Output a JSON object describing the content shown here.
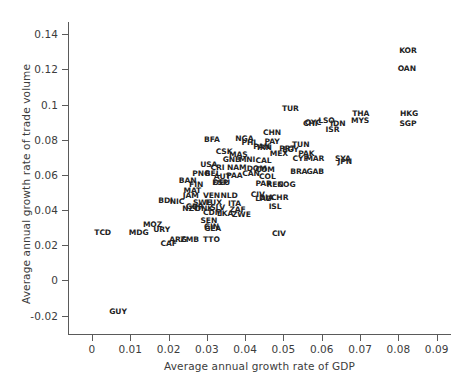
{
  "chart_data": {
    "type": "scatter",
    "title": "",
    "xlabel": "Average annual growth rate of GDP",
    "ylabel": "Average annual growth rate of trade volume",
    "xlim": [
      -0.006,
      0.094
    ],
    "ylim": [
      -0.031,
      0.147
    ],
    "xticks": [
      "0",
      "0.01",
      "0.02",
      "0.03",
      "0.04",
      "0.05",
      "0.06",
      "0.07",
      "0.08",
      "0.09"
    ],
    "xtick_values": [
      0,
      0.01,
      0.02,
      0.03,
      0.04,
      0.05,
      0.06,
      0.07,
      0.08,
      0.09
    ],
    "yticks": [
      "-0.02",
      "0",
      "0.02",
      "0.04",
      "0.06",
      "0.08",
      "0.1",
      "0.12",
      "0.14"
    ],
    "ytick_values": [
      -0.02,
      0,
      0.02,
      0.04,
      0.06,
      0.08,
      0.1,
      0.12,
      0.14
    ],
    "grid": false,
    "legend": null,
    "marker_style": "text-label",
    "point_label_field": "code",
    "points": [
      {
        "code": "KOR",
        "x": 0.0825,
        "y": 0.1305
      },
      {
        "code": "OAN",
        "x": 0.0822,
        "y": 0.1205
      },
      {
        "code": "TUR",
        "x": 0.0518,
        "y": 0.0975
      },
      {
        "code": "THA",
        "x": 0.0702,
        "y": 0.0945
      },
      {
        "code": "HKG",
        "x": 0.0828,
        "y": 0.0945
      },
      {
        "code": "MYS",
        "x": 0.07,
        "y": 0.0905
      },
      {
        "code": "SGP",
        "x": 0.0825,
        "y": 0.0888
      },
      {
        "code": "LSO",
        "x": 0.0612,
        "y": 0.0908
      },
      {
        "code": "IDN",
        "x": 0.0642,
        "y": 0.089
      },
      {
        "code": "OYC",
        "x": 0.0577,
        "y": 0.0893
      },
      {
        "code": "CHI",
        "x": 0.057,
        "y": 0.0888
      },
      {
        "code": "ISR",
        "x": 0.0628,
        "y": 0.0858
      },
      {
        "code": "BFA",
        "x": 0.0313,
        "y": 0.08
      },
      {
        "code": "CHN",
        "x": 0.047,
        "y": 0.084
      },
      {
        "code": "NGA",
        "x": 0.0398,
        "y": 0.0805
      },
      {
        "code": "PAY",
        "x": 0.047,
        "y": 0.079
      },
      {
        "code": "PHL",
        "x": 0.0412,
        "y": 0.0783
      },
      {
        "code": "TUN",
        "x": 0.0545,
        "y": 0.077
      },
      {
        "code": "PAN",
        "x": 0.0443,
        "y": 0.0758
      },
      {
        "code": "IRN",
        "x": 0.045,
        "y": 0.0755
      },
      {
        "code": "PRT",
        "x": 0.051,
        "y": 0.0748
      },
      {
        "code": "EGY",
        "x": 0.0518,
        "y": 0.074
      },
      {
        "code": "CSK",
        "x": 0.0345,
        "y": 0.0728
      },
      {
        "code": "MAS",
        "x": 0.0382,
        "y": 0.0713
      },
      {
        "code": "MEX",
        "x": 0.0488,
        "y": 0.0718
      },
      {
        "code": "PAK",
        "x": 0.056,
        "y": 0.0718
      },
      {
        "code": "CYP",
        "x": 0.0545,
        "y": 0.069
      },
      {
        "code": "MAR",
        "x": 0.0582,
        "y": 0.069
      },
      {
        "code": "SYA",
        "x": 0.0655,
        "y": 0.069
      },
      {
        "code": "JPN",
        "x": 0.066,
        "y": 0.0672
      },
      {
        "code": "GNB",
        "x": 0.0365,
        "y": 0.0688
      },
      {
        "code": "MNI",
        "x": 0.0405,
        "y": 0.0685
      },
      {
        "code": "CAL",
        "x": 0.0448,
        "y": 0.0678
      },
      {
        "code": "USA",
        "x": 0.0305,
        "y": 0.0655
      },
      {
        "code": "CRI",
        "x": 0.0328,
        "y": 0.0638
      },
      {
        "code": "NAM",
        "x": 0.0378,
        "y": 0.064
      },
      {
        "code": "DOM",
        "x": 0.043,
        "y": 0.0635
      },
      {
        "code": "COM",
        "x": 0.0452,
        "y": 0.0628
      },
      {
        "code": "BRA",
        "x": 0.054,
        "y": 0.0618
      },
      {
        "code": "GAB",
        "x": 0.0583,
        "y": 0.0618
      },
      {
        "code": "PNG",
        "x": 0.0285,
        "y": 0.0605
      },
      {
        "code": "BEL",
        "x": 0.0315,
        "y": 0.0608
      },
      {
        "code": "AUT",
        "x": 0.034,
        "y": 0.0588
      },
      {
        "code": "PAA",
        "x": 0.0372,
        "y": 0.0595
      },
      {
        "code": "CAN",
        "x": 0.0415,
        "y": 0.0603
      },
      {
        "code": "COL",
        "x": 0.0458,
        "y": 0.0588
      },
      {
        "code": "BAN",
        "x": 0.025,
        "y": 0.0568
      },
      {
        "code": "FIN",
        "x": 0.0272,
        "y": 0.0545
      },
      {
        "code": "ESP",
        "x": 0.0335,
        "y": 0.0555
      },
      {
        "code": "DEU",
        "x": 0.0338,
        "y": 0.0552
      },
      {
        "code": "PAR",
        "x": 0.0448,
        "y": 0.055
      },
      {
        "code": "REN",
        "x": 0.0478,
        "y": 0.0545
      },
      {
        "code": "COG",
        "x": 0.0508,
        "y": 0.0545
      },
      {
        "code": "MAT",
        "x": 0.0262,
        "y": 0.0508
      },
      {
        "code": "JAM",
        "x": 0.0258,
        "y": 0.0478
      },
      {
        "code": "VEN",
        "x": 0.0312,
        "y": 0.0478
      },
      {
        "code": "NLD",
        "x": 0.0358,
        "y": 0.0478
      },
      {
        "code": "CIV",
        "x": 0.0433,
        "y": 0.0488
      },
      {
        "code": "DIA",
        "x": 0.0455,
        "y": 0.047
      },
      {
        "code": "CHR",
        "x": 0.049,
        "y": 0.0468
      },
      {
        "code": "LAD",
        "x": 0.0448,
        "y": 0.0462
      },
      {
        "code": "BDI",
        "x": 0.0192,
        "y": 0.045
      },
      {
        "code": "NIC",
        "x": 0.0222,
        "y": 0.0448
      },
      {
        "code": "SWE",
        "x": 0.0288,
        "y": 0.0443
      },
      {
        "code": "LUX",
        "x": 0.0318,
        "y": 0.044
      },
      {
        "code": "ITA",
        "x": 0.0372,
        "y": 0.0435
      },
      {
        "code": "ISL",
        "x": 0.0478,
        "y": 0.0418
      },
      {
        "code": "NZC",
        "x": 0.0258,
        "y": 0.0408
      },
      {
        "code": "GBR",
        "x": 0.0268,
        "y": 0.0418
      },
      {
        "code": "DNK",
        "x": 0.0292,
        "y": 0.0408
      },
      {
        "code": "SLV",
        "x": 0.0328,
        "y": 0.0412
      },
      {
        "code": "ZAF",
        "x": 0.038,
        "y": 0.04
      },
      {
        "code": "CDM",
        "x": 0.0315,
        "y": 0.0382
      },
      {
        "code": "LKA",
        "x": 0.0348,
        "y": 0.0378
      },
      {
        "code": "ZWE",
        "x": 0.039,
        "y": 0.0375
      },
      {
        "code": "MOZ",
        "x": 0.0158,
        "y": 0.0315
      },
      {
        "code": "URY",
        "x": 0.0182,
        "y": 0.0288
      },
      {
        "code": "SEN",
        "x": 0.0305,
        "y": 0.0338
      },
      {
        "code": "GIN",
        "x": 0.0312,
        "y": 0.0302
      },
      {
        "code": "GEA",
        "x": 0.0315,
        "y": 0.0295
      },
      {
        "code": "TCD",
        "x": 0.0028,
        "y": 0.0272
      },
      {
        "code": "MDG",
        "x": 0.0122,
        "y": 0.0268
      },
      {
        "code": "CIV",
        "x": 0.0488,
        "y": 0.0262
      },
      {
        "code": "ARG",
        "x": 0.0225,
        "y": 0.0228
      },
      {
        "code": "ZMB",
        "x": 0.0255,
        "y": 0.0228
      },
      {
        "code": "TTO",
        "x": 0.0312,
        "y": 0.0228
      },
      {
        "code": "CAF",
        "x": 0.02,
        "y": 0.0205
      },
      {
        "code": "GUY",
        "x": 0.0068,
        "y": -0.0182
      }
    ]
  },
  "axes": {
    "x_title": "Average annual growth rate of GDP",
    "y_title": "Average annual growth rate of trade volume"
  }
}
